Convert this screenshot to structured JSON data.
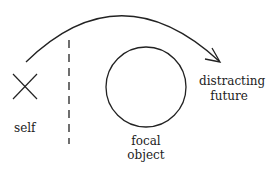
{
  "diagram": {
    "labels": {
      "self": "self",
      "focal_line1": "focal",
      "focal_line2": "object",
      "distract_line1": "distracting",
      "distract_line2": "future"
    },
    "elements": [
      "self-marker (X)",
      "dashed-boundary",
      "focal-object circle",
      "arc arrow from self over focal object to distracting future"
    ],
    "stroke_color": "#222222"
  }
}
